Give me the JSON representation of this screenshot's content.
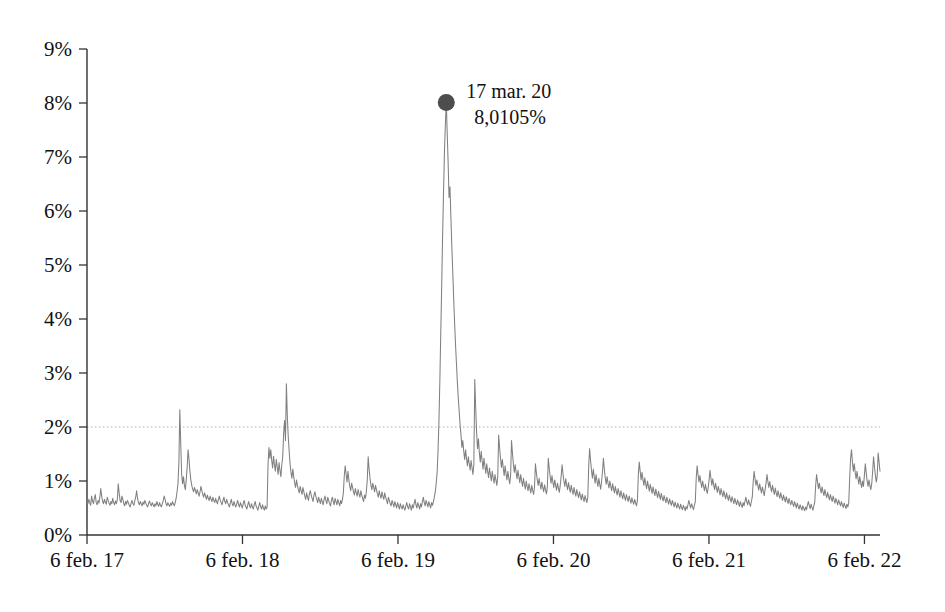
{
  "chart_data": {
    "type": "line",
    "title": "",
    "subtitle": "",
    "xlabel": "",
    "ylabel": "",
    "grid": false,
    "legend": false,
    "legend_position": "none",
    "line_color": "#808080",
    "marker_color": "#4d4d4d",
    "axis_color": "#333333",
    "reference_line": {
      "value": 2,
      "label": "2%",
      "style": "dotted",
      "color": "#b0b0b0"
    },
    "ylim": [
      0,
      9
    ],
    "ytick_labels": [
      "0%",
      "1%",
      "2%",
      "3%",
      "4%",
      "5%",
      "6%",
      "7%",
      "8%",
      "9%"
    ],
    "ytick_values": [
      0,
      1,
      2,
      3,
      4,
      5,
      6,
      7,
      8,
      9
    ],
    "xtick_labels": [
      "6 feb. 17",
      "6 feb. 18",
      "6 feb. 19",
      "6 feb. 20",
      "6 feb. 21",
      "6 feb. 22"
    ],
    "xtick_values": [
      0,
      1,
      2,
      3,
      4,
      5
    ],
    "xlim": [
      0,
      5.1
    ],
    "annotations": [
      {
        "name": "peak-annotation",
        "line1": "17 mar. 20",
        "line2": "8,0105%",
        "x": 3.105,
        "y": 8.0105,
        "marker": "circle"
      }
    ],
    "series": [
      {
        "name": "spread",
        "units": "%",
        "x_start": "6 feb. 17",
        "x_end": "6 feb. 22",
        "values": [
          0.62,
          0.58,
          0.66,
          0.6,
          0.55,
          0.72,
          0.63,
          0.58,
          0.68,
          0.75,
          0.6,
          0.56,
          0.64,
          0.59,
          0.7,
          0.86,
          0.72,
          0.62,
          0.58,
          0.66,
          0.61,
          0.57,
          0.7,
          0.64,
          0.59,
          0.55,
          0.62,
          0.58,
          0.68,
          0.6,
          0.56,
          0.63,
          0.58,
          0.66,
          0.95,
          0.78,
          0.64,
          0.6,
          0.72,
          0.66,
          0.58,
          0.54,
          0.62,
          0.57,
          0.64,
          0.6,
          0.55,
          0.52,
          0.59,
          0.64,
          0.58,
          0.55,
          0.63,
          0.7,
          0.82,
          0.68,
          0.6,
          0.56,
          0.62,
          0.58,
          0.54,
          0.61,
          0.57,
          0.64,
          0.59,
          0.55,
          0.52,
          0.58,
          0.63,
          0.57,
          0.54,
          0.6,
          0.56,
          0.52,
          0.58,
          0.54,
          0.62,
          0.57,
          0.53,
          0.6,
          0.55,
          0.52,
          0.58,
          0.64,
          0.72,
          0.66,
          0.58,
          0.54,
          0.6,
          0.56,
          0.53,
          0.59,
          0.55,
          0.62,
          0.58,
          0.54,
          0.6,
          0.68,
          0.8,
          0.95,
          1.35,
          2.32,
          1.7,
          1.12,
          0.95,
          1.08,
          0.92,
          0.84,
          1.02,
          1.26,
          1.58,
          1.4,
          1.18,
          1.02,
          0.92,
          0.85,
          0.8,
          0.88,
          0.82,
          0.76,
          0.84,
          0.78,
          0.72,
          0.8,
          0.9,
          0.82,
          0.75,
          0.7,
          0.78,
          0.72,
          0.66,
          0.74,
          0.68,
          0.64,
          0.72,
          0.66,
          0.62,
          0.7,
          0.64,
          0.6,
          0.68,
          0.62,
          0.58,
          0.66,
          0.72,
          0.64,
          0.6,
          0.56,
          0.64,
          0.7,
          0.62,
          0.58,
          0.66,
          0.6,
          0.56,
          0.52,
          0.6,
          0.66,
          0.58,
          0.54,
          0.62,
          0.56,
          0.52,
          0.58,
          0.64,
          0.56,
          0.52,
          0.6,
          0.55,
          0.5,
          0.58,
          0.64,
          0.56,
          0.52,
          0.48,
          0.56,
          0.62,
          0.54,
          0.5,
          0.58,
          0.52,
          0.48,
          0.56,
          0.62,
          0.54,
          0.5,
          0.46,
          0.54,
          0.6,
          0.52,
          0.48,
          0.56,
          0.5,
          0.46,
          0.54,
          0.48,
          0.52,
          1.3,
          1.62,
          1.42,
          1.58,
          1.38,
          1.24,
          1.46,
          1.3,
          1.18,
          1.4,
          1.26,
          1.12,
          1.34,
          1.2,
          1.08,
          1.3,
          1.45,
          1.88,
          2.12,
          1.75,
          2.8,
          2.2,
          1.82,
          1.55,
          1.32,
          1.16,
          1.05,
          1.22,
          1.08,
          0.96,
          0.88,
          1.02,
          0.92,
          0.84,
          0.78,
          0.9,
          0.82,
          0.75,
          0.88,
          0.8,
          0.72,
          0.66,
          0.78,
          0.7,
          0.64,
          0.76,
          0.82,
          0.74,
          0.68,
          0.62,
          0.74,
          0.8,
          0.72,
          0.66,
          0.6,
          0.7,
          0.64,
          0.58,
          0.68,
          0.62,
          0.56,
          0.66,
          0.72,
          0.64,
          0.58,
          0.7,
          0.64,
          0.58,
          0.54,
          0.64,
          0.7,
          0.62,
          0.56,
          0.68,
          0.62,
          0.56,
          0.66,
          0.6,
          0.54,
          0.64,
          0.58,
          0.66,
          0.78,
          1.1,
          1.28,
          1.12,
          0.98,
          1.18,
          1.02,
          0.9,
          0.82,
          0.96,
          0.88,
          0.8,
          0.74,
          0.86,
          0.78,
          0.72,
          0.84,
          0.76,
          0.7,
          0.82,
          0.74,
          0.68,
          0.62,
          0.74,
          0.68,
          0.8,
          1.02,
          1.45,
          1.22,
          1.05,
          0.92,
          0.84,
          0.96,
          0.88,
          0.8,
          0.92,
          0.84,
          0.76,
          0.7,
          0.82,
          0.74,
          0.68,
          0.8,
          0.72,
          0.66,
          0.78,
          0.7,
          0.64,
          0.58,
          0.7,
          0.64,
          0.58,
          0.54,
          0.64,
          0.58,
          0.52,
          0.62,
          0.56,
          0.5,
          0.6,
          0.54,
          0.48,
          0.58,
          0.52,
          0.48,
          0.56,
          0.5,
          0.46,
          0.54,
          0.6,
          0.52,
          0.48,
          0.58,
          0.52,
          0.46,
          0.56,
          0.5,
          0.58,
          0.66,
          0.56,
          0.5,
          0.6,
          0.54,
          0.48,
          0.58,
          0.52,
          0.62,
          0.7,
          0.6,
          0.54,
          0.64,
          0.58,
          0.52,
          0.62,
          0.56,
          0.5,
          0.6,
          0.55,
          0.62,
          0.7,
          0.8,
          0.95,
          1.15,
          1.55,
          2.1,
          2.85,
          3.75,
          4.6,
          5.55,
          6.35,
          7.1,
          7.6,
          8.0105,
          7.45,
          6.9,
          6.25,
          6.45,
          5.9,
          5.35,
          4.9,
          4.4,
          3.95,
          3.55,
          3.2,
          2.85,
          2.55,
          2.3,
          2.05,
          1.85,
          1.62,
          1.75,
          1.55,
          1.4,
          1.58,
          1.42,
          1.28,
          1.45,
          1.32,
          1.2,
          1.38,
          1.25,
          1.12,
          1.3,
          2.88,
          2.35,
          1.9,
          1.6,
          1.78,
          1.52,
          1.35,
          1.55,
          1.38,
          1.22,
          1.42,
          1.28,
          1.14,
          1.32,
          1.18,
          1.06,
          1.24,
          1.12,
          1.0,
          1.18,
          1.06,
          0.96,
          1.12,
          1.02,
          0.92,
          1.08,
          1.85,
          1.62,
          1.42,
          1.25,
          1.4,
          1.24,
          1.1,
          1.28,
          1.14,
          1.02,
          1.18,
          1.06,
          0.95,
          1.1,
          1.75,
          1.52,
          1.32,
          1.16,
          1.3,
          1.16,
          1.04,
          1.2,
          1.08,
          0.97,
          1.12,
          1.0,
          0.9,
          1.05,
          0.94,
          0.85,
          1.0,
          0.9,
          0.82,
          0.95,
          0.86,
          0.78,
          0.92,
          0.83,
          0.75,
          0.88,
          1.32,
          1.16,
          1.02,
          0.92,
          1.05,
          0.94,
          0.85,
          0.98,
          0.88,
          0.8,
          0.93,
          0.84,
          0.76,
          0.89,
          1.42,
          1.24,
          1.08,
          0.96,
          1.1,
          0.98,
          0.88,
          1.02,
          0.92,
          0.83,
          0.96,
          0.87,
          0.79,
          0.92,
          1.08,
          1.3,
          1.14,
          1.0,
          0.9,
          1.04,
          0.93,
          0.84,
          0.97,
          0.87,
          0.79,
          0.92,
          0.83,
          0.75,
          0.88,
          0.79,
          0.72,
          0.84,
          0.76,
          0.69,
          0.8,
          0.72,
          0.65,
          0.76,
          0.68,
          0.62,
          0.73,
          0.66,
          0.6,
          0.7,
          1.28,
          1.6,
          1.38,
          1.2,
          1.05,
          1.22,
          1.08,
          0.96,
          1.12,
          1.0,
          0.9,
          1.05,
          0.94,
          0.85,
          0.99,
          1.18,
          1.42,
          1.22,
          1.06,
          0.94,
          1.08,
          0.96,
          0.87,
          1.0,
          0.9,
          0.82,
          0.95,
          0.86,
          0.78,
          0.9,
          0.81,
          0.74,
          0.86,
          0.78,
          0.7,
          0.82,
          0.74,
          0.67,
          0.78,
          0.7,
          0.64,
          0.75,
          0.68,
          0.62,
          0.72,
          0.65,
          0.59,
          0.69,
          0.62,
          0.57,
          0.66,
          0.6,
          0.54,
          0.64,
          1.12,
          1.35,
          1.18,
          1.02,
          1.16,
          1.03,
          0.92,
          1.06,
          0.95,
          0.86,
          1.0,
          0.9,
          0.81,
          0.94,
          0.85,
          0.77,
          0.89,
          0.8,
          0.73,
          0.85,
          0.76,
          0.69,
          0.81,
          0.73,
          0.66,
          0.77,
          0.69,
          0.63,
          0.73,
          0.66,
          0.6,
          0.7,
          0.63,
          0.57,
          0.67,
          0.6,
          0.55,
          0.64,
          0.58,
          0.52,
          0.61,
          0.55,
          0.5,
          0.59,
          0.53,
          0.48,
          0.57,
          0.51,
          0.47,
          0.55,
          0.5,
          0.45,
          0.53,
          0.48,
          0.56,
          0.64,
          0.56,
          0.5,
          0.58,
          0.52,
          0.47,
          0.55,
          0.62,
          1.05,
          1.28,
          1.12,
          0.98,
          1.1,
          0.98,
          0.88,
          1.0,
          0.9,
          0.82,
          0.94,
          0.85,
          0.77,
          0.88,
          1.02,
          1.2,
          1.05,
          0.92,
          1.04,
          0.93,
          0.84,
          0.96,
          0.87,
          0.79,
          0.9,
          0.82,
          0.74,
          0.86,
          0.78,
          0.71,
          0.82,
          0.74,
          0.67,
          0.78,
          0.7,
          0.64,
          0.74,
          0.67,
          0.61,
          0.71,
          0.64,
          0.58,
          0.68,
          0.61,
          0.56,
          0.65,
          0.59,
          0.53,
          0.62,
          0.56,
          0.51,
          0.6,
          0.54,
          0.62,
          0.7,
          0.62,
          0.56,
          0.65,
          0.58,
          0.53,
          0.62,
          0.7,
          0.98,
          1.18,
          1.04,
          0.92,
          1.02,
          0.92,
          0.83,
          0.95,
          0.86,
          0.78,
          0.89,
          0.81,
          0.73,
          0.85,
          0.96,
          1.12,
          0.99,
          0.88,
          0.99,
          0.89,
          0.8,
          0.92,
          0.83,
          0.75,
          0.87,
          0.78,
          0.71,
          0.82,
          0.74,
          0.68,
          0.78,
          0.7,
          0.64,
          0.74,
          0.67,
          0.61,
          0.71,
          0.64,
          0.58,
          0.68,
          0.61,
          0.56,
          0.64,
          0.58,
          0.53,
          0.62,
          0.56,
          0.5,
          0.59,
          0.53,
          0.48,
          0.56,
          0.51,
          0.46,
          0.54,
          0.49,
          0.45,
          0.52,
          0.47,
          0.55,
          0.62,
          0.55,
          0.49,
          0.57,
          0.51,
          0.46,
          0.54,
          0.62,
          0.92,
          1.12,
          0.98,
          0.86,
          0.96,
          0.86,
          0.78,
          0.89,
          0.8,
          0.73,
          0.84,
          0.76,
          0.69,
          0.79,
          0.72,
          0.65,
          0.75,
          0.68,
          0.62,
          0.72,
          0.65,
          0.59,
          0.68,
          0.62,
          0.56,
          0.65,
          0.59,
          0.54,
          0.62,
          0.56,
          0.51,
          0.59,
          0.54,
          0.49,
          0.57,
          0.52,
          0.6,
          1.05,
          1.42,
          1.58,
          1.35,
          1.18,
          1.32,
          1.16,
          1.04,
          1.18,
          1.05,
          0.94,
          1.08,
          0.97,
          0.88,
          1.0,
          0.9,
          1.1,
          1.32,
          1.15,
          1.0,
          0.9,
          1.02,
          0.92,
          0.84,
          0.95,
          1.18,
          1.45,
          1.26,
          1.1,
          0.98,
          1.1,
          1.52,
          1.35,
          1.18
        ]
      }
    ]
  }
}
